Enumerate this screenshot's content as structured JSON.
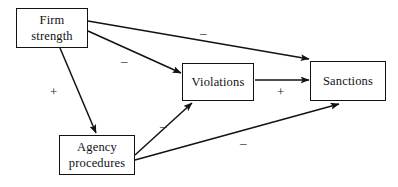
{
  "diagram": {
    "type": "path-diagram",
    "nodes": [
      {
        "id": "firm_strength",
        "label": "Firm\nstrength"
      },
      {
        "id": "violations",
        "label": "Violations"
      },
      {
        "id": "sanctions",
        "label": "Sanctions"
      },
      {
        "id": "agency_procedures",
        "label": "Agency\nprocedures"
      }
    ],
    "edges": [
      {
        "id": "firm_to_sanctions",
        "from": "firm_strength",
        "to": "sanctions",
        "sign": "–"
      },
      {
        "id": "firm_to_violations",
        "from": "firm_strength",
        "to": "violations",
        "sign": "–"
      },
      {
        "id": "firm_to_agency",
        "from": "firm_strength",
        "to": "agency_procedures",
        "sign": "+"
      },
      {
        "id": "violations_to_sanctions",
        "from": "violations",
        "to": "sanctions",
        "sign": "+"
      },
      {
        "id": "agency_to_violations",
        "from": "agency_procedures",
        "to": "violations",
        "sign": "–"
      },
      {
        "id": "agency_to_sanctions",
        "from": "agency_procedures",
        "to": "sanctions",
        "sign": "–"
      }
    ],
    "colors": {
      "line": "#121212",
      "text": "#111111",
      "background": "#ffffff"
    }
  }
}
